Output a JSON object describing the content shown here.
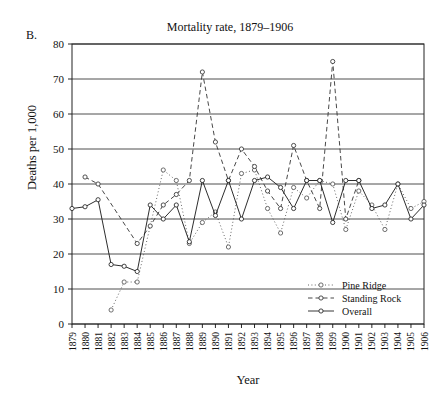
{
  "panel": {
    "label": "B."
  },
  "chart_data": {
    "type": "line",
    "title": "Mortality rate, 1879–1906",
    "xlabel": "Year",
    "ylabel": "Deaths per 1,000",
    "xlim": [
      1879,
      1906
    ],
    "ylim": [
      0,
      80
    ],
    "yticks": [
      0,
      10,
      20,
      30,
      40,
      50,
      60,
      70,
      80
    ],
    "grid": "horizontal",
    "legend_position": "bottom-right",
    "categories": [
      1879,
      1880,
      1881,
      1882,
      1883,
      1884,
      1885,
      1886,
      1887,
      1888,
      1889,
      1890,
      1891,
      1892,
      1893,
      1894,
      1895,
      1896,
      1897,
      1898,
      1899,
      1900,
      1901,
      1902,
      1903,
      1904,
      1905,
      1906
    ],
    "series": [
      {
        "name": "Pine Ridge",
        "marker": "circle",
        "linestyle": "dotted",
        "color": "#555555",
        "x": [
          1882,
          1883,
          1884,
          1886,
          1887,
          1888,
          1889,
          1890,
          1891,
          1892,
          1893,
          1894,
          1895,
          1896,
          1897,
          1898,
          1899,
          1900,
          1901,
          1902,
          1903,
          1904,
          1905,
          1906
        ],
        "values": [
          4,
          12,
          12,
          44,
          41,
          23,
          29,
          32,
          22,
          43,
          44,
          33,
          26,
          39,
          36,
          41,
          40,
          27,
          38,
          34,
          27,
          40,
          33,
          35
        ]
      },
      {
        "name": "Standing Rock",
        "marker": "circle",
        "linestyle": "dashed",
        "color": "#333333",
        "x": [
          1880,
          1881,
          1884,
          1885,
          1886,
          1887,
          1888,
          1889,
          1890,
          1891,
          1892,
          1893,
          1894,
          1895,
          1896,
          1897,
          1898,
          1899,
          1900,
          1901
        ],
        "values": [
          42,
          40,
          23,
          28,
          34,
          37,
          41,
          72,
          52,
          41,
          50,
          45,
          38,
          33,
          51,
          41,
          33,
          75,
          30,
          41
        ]
      },
      {
        "name": "Overall",
        "marker": "circle",
        "linestyle": "solid",
        "color": "#222222",
        "x": [
          1879,
          1880,
          1881,
          1882,
          1883,
          1884,
          1885,
          1886,
          1887,
          1888,
          1889,
          1890,
          1891,
          1892,
          1893,
          1894,
          1895,
          1896,
          1897,
          1898,
          1899,
          1900,
          1901,
          1902,
          1903,
          1904,
          1905,
          1906
        ],
        "values": [
          33,
          33.5,
          35.5,
          17,
          16.5,
          15,
          34,
          30,
          34,
          23.5,
          41,
          31,
          41,
          30,
          41,
          42,
          39,
          33,
          41,
          41,
          29,
          41,
          41,
          33,
          34,
          40,
          30,
          34
        ]
      }
    ]
  },
  "legend": {
    "items": [
      {
        "label": "Pine Ridge"
      },
      {
        "label": "Standing Rock"
      },
      {
        "label": "Overall"
      }
    ]
  }
}
